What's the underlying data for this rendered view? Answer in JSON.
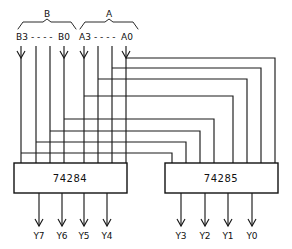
{
  "diagram": {
    "line_color": "#1a1a1a",
    "background": "#ffffff"
  },
  "groups": [
    {
      "name": "group-b",
      "label": "B",
      "x": 47,
      "y": 15,
      "bracket_left": 18,
      "bracket_right": 76,
      "bracket_y": 22
    },
    {
      "name": "group-a",
      "label": "A",
      "x": 109,
      "y": 15,
      "bracket_left": 80,
      "bracket_right": 138,
      "bracket_y": 22
    }
  ],
  "input_labels": [
    {
      "name": "input-label-b3",
      "text": "B3",
      "x": 16,
      "y": 40
    },
    {
      "name": "input-label-b-dots",
      "text": "- - - -",
      "x": 31,
      "y": 40
    },
    {
      "name": "input-label-b0",
      "text": "B0",
      "x": 58,
      "y": 40
    },
    {
      "name": "input-label-a3",
      "text": "A3",
      "x": 79,
      "y": 40
    },
    {
      "name": "input-label-a-dots",
      "text": "- - - -",
      "x": 94,
      "y": 40
    },
    {
      "name": "input-label-a0",
      "text": "A0",
      "x": 121,
      "y": 40
    }
  ],
  "inputs": [
    {
      "name": "input-b3",
      "label": "B3",
      "x": 21,
      "arrow": true
    },
    {
      "name": "input-b2",
      "label": "B2",
      "x": 36,
      "arrow": false
    },
    {
      "name": "input-b1",
      "label": "B1",
      "x": 50,
      "arrow": false
    },
    {
      "name": "input-b0",
      "label": "B0",
      "x": 64,
      "arrow": true
    },
    {
      "name": "input-a3",
      "label": "A3",
      "x": 84,
      "arrow": true
    },
    {
      "name": "input-a2",
      "label": "A2",
      "x": 98,
      "arrow": false
    },
    {
      "name": "input-a1",
      "label": "A1",
      "x": 112,
      "arrow": false
    },
    {
      "name": "input-a0",
      "label": "A0",
      "x": 126,
      "arrow": true
    }
  ],
  "chips": [
    {
      "name": "chip-74284",
      "label": "74284",
      "x": 14,
      "y": 163,
      "width": 113,
      "height": 30,
      "label_x": 70,
      "label_y": 182,
      "top_pins": [
        21,
        36,
        50,
        64,
        84,
        98,
        112,
        126
      ],
      "bottom_pins": [
        39,
        62,
        84,
        107
      ]
    },
    {
      "name": "chip-74285",
      "label": "74285",
      "x": 165,
      "y": 163,
      "width": 113,
      "height": 30,
      "label_x": 221,
      "label_y": 182,
      "top_pins": [
        172,
        186,
        200,
        214,
        233,
        247,
        261,
        275
      ],
      "bottom_pins": [
        181,
        205,
        228,
        252
      ]
    }
  ],
  "branch_wires": [
    {
      "name": "branch-wire-a0",
      "source_x": 126,
      "branch_y": 58,
      "drop_x": 275
    },
    {
      "name": "branch-wire-a1",
      "source_x": 112,
      "branch_y": 68,
      "drop_x": 261
    },
    {
      "name": "branch-wire-a2",
      "source_x": 98,
      "branch_y": 79,
      "drop_x": 247
    },
    {
      "name": "branch-wire-a3",
      "source_x": 84,
      "branch_y": 96,
      "drop_x": 233
    },
    {
      "name": "branch-wire-b0",
      "source_x": 64,
      "branch_y": 119,
      "drop_x": 214
    },
    {
      "name": "branch-wire-b1",
      "source_x": 50,
      "branch_y": 131,
      "drop_x": 200
    },
    {
      "name": "branch-wire-b2",
      "source_x": 36,
      "branch_y": 142,
      "drop_x": 186
    },
    {
      "name": "branch-wire-b3",
      "source_x": 21,
      "branch_y": 153,
      "drop_x": 172
    }
  ],
  "outputs_left": [
    {
      "name": "output-y7",
      "label": "Y7",
      "x": 39
    },
    {
      "name": "output-y6",
      "label": "Y6",
      "x": 62
    },
    {
      "name": "output-y5",
      "label": "Y5",
      "x": 84
    },
    {
      "name": "output-y4",
      "label": "Y4",
      "x": 107
    }
  ],
  "outputs_right": [
    {
      "name": "output-y3",
      "label": "Y3",
      "x": 181
    },
    {
      "name": "output-y2",
      "label": "Y2",
      "x": 205
    },
    {
      "name": "output-y1",
      "label": "Y1",
      "x": 228
    },
    {
      "name": "output-y0",
      "label": "Y0",
      "x": 252
    }
  ],
  "geometry": {
    "input_line_top": 46,
    "input_arrow_tip_y": 58,
    "chip_top_y": 163,
    "chip_bottom_y": 193,
    "output_stub_bottom": 226,
    "output_label_y": 239
  }
}
